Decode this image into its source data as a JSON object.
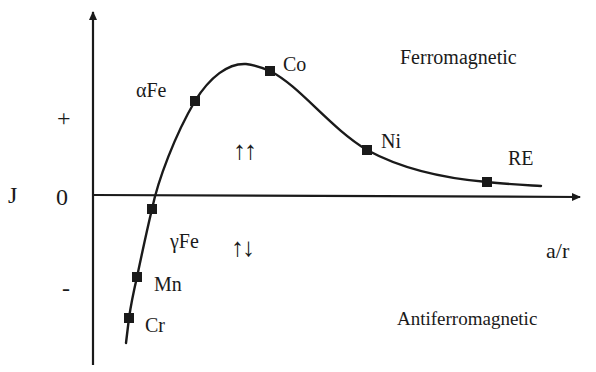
{
  "diagram": {
    "title": "",
    "axes": {
      "y_label": "J",
      "x_label": "a/r",
      "y_ticks": {
        "plus": "+",
        "zero": "0",
        "minus": "-"
      }
    },
    "regions": {
      "upper": "Ferromagnetic",
      "lower": "Antiferromagnetic"
    },
    "spin_symbols": {
      "parallel": "↑↑",
      "antiparallel": "↑↓"
    },
    "points": [
      {
        "label": "Cr",
        "x": 129,
        "y": 318
      },
      {
        "label": "Mn",
        "x": 137,
        "y": 277
      },
      {
        "label": "γFe",
        "x": 152,
        "y": 209
      },
      {
        "label": "αFe",
        "x": 195,
        "y": 101
      },
      {
        "label": "Co",
        "x": 270,
        "y": 71
      },
      {
        "label": "Ni",
        "x": 367,
        "y": 150
      },
      {
        "label": "RE",
        "x": 487,
        "y": 182
      }
    ],
    "colors": {
      "ink": "#1a1a1a",
      "background": "#ffffff"
    }
  },
  "chart_data": {
    "type": "line",
    "xlabel": "a/r",
    "ylabel": "J",
    "y_tick_labels": [
      "-",
      "0",
      "+"
    ],
    "series": [
      {
        "name": "exchange integral J vs a/r",
        "points": [
          {
            "label": "Cr",
            "sign": "negative",
            "rel_y": -1.26
          },
          {
            "label": "Mn",
            "sign": "negative",
            "rel_y": -0.86
          },
          {
            "label": "γFe",
            "sign": "negative (near zero)",
            "rel_y": -0.14
          },
          {
            "label": "αFe",
            "sign": "positive",
            "rel_y": 0.93
          },
          {
            "label": "Co",
            "sign": "positive (near maximum)",
            "rel_y": 1.22
          },
          {
            "label": "Ni",
            "sign": "positive",
            "rel_y": 0.44
          },
          {
            "label": "RE",
            "sign": "positive (small)",
            "rel_y": 0.13
          }
        ]
      }
    ],
    "annotations": [
      "Ferromagnetic",
      "Antiferromagnetic",
      "↑↑",
      "↑↓"
    ],
    "grid": false,
    "legend": "none"
  }
}
